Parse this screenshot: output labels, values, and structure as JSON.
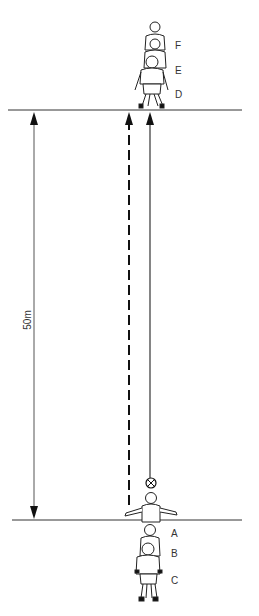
{
  "diagram": {
    "title": "",
    "distance_label": "50m",
    "players_top": [
      {
        "label": "F"
      },
      {
        "label": "E"
      },
      {
        "label": "D"
      }
    ],
    "players_bottom": [
      {
        "label": "A"
      },
      {
        "label": "B"
      },
      {
        "label": "C"
      }
    ],
    "lines": {
      "top_line": "finish line",
      "bottom_line": "start line",
      "dashed_arrow": "player run",
      "solid_arrow": "ball path"
    },
    "icons": {
      "ball": "football-icon"
    },
    "colors": {
      "line": "#222222",
      "background": "#ffffff"
    }
  }
}
